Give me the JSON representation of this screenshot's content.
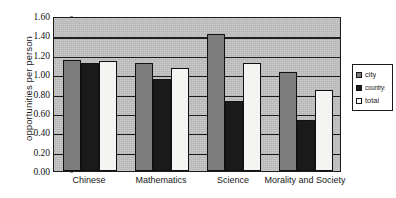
{
  "chart_data": {
    "type": "bar",
    "title": "",
    "xlabel": "",
    "ylabel": "opportunities per person",
    "ylim": [
      0.0,
      1.6
    ],
    "ytick_labels": [
      "0.00",
      "0.20",
      "0.40",
      "0.60",
      "0.80",
      "1.00",
      "1.20",
      "1.40",
      "1.60"
    ],
    "ytick_values": [
      0.0,
      0.2,
      0.4,
      0.6,
      0.8,
      1.0,
      1.2,
      1.4,
      1.6
    ],
    "grid": true,
    "grid_axis": "y",
    "legend_position": "right",
    "categories": [
      "Chinese",
      "Mathematics",
      "Science",
      "Morality and Society"
    ],
    "series": [
      {
        "name": "city",
        "color": "#7d7d7d",
        "values": [
          1.15,
          1.12,
          1.41,
          1.02
        ]
      },
      {
        "name": "countryside",
        "color": "#1a1a1a",
        "values": [
          1.11,
          0.95,
          0.72,
          0.53
        ]
      },
      {
        "name": "total",
        "color": "#f4f4f2",
        "values": [
          1.14,
          1.06,
          1.12,
          0.84
        ]
      }
    ]
  },
  "legend": {
    "items": [
      {
        "label": "city"
      },
      {
        "label": "countryside"
      },
      {
        "label": "total"
      }
    ]
  }
}
